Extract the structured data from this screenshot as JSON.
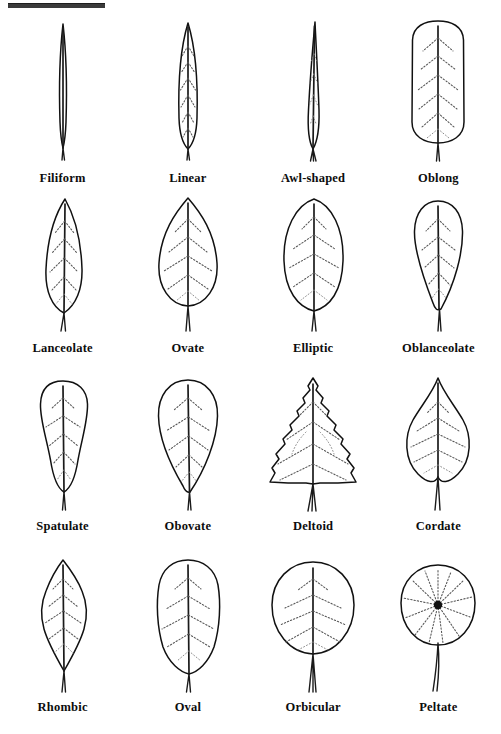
{
  "figure": {
    "top_rule": true,
    "background_color": "#ffffff",
    "ink_color": "#111111",
    "vein_color": "#555555",
    "columns": 4,
    "rows": 4
  },
  "leaves": [
    {
      "id": "filiform",
      "label": "Filiform",
      "row": 1,
      "col": 1,
      "shape": "thread-like, extremely narrow, parallel sides",
      "margin": "entire",
      "venation": "pinnate"
    },
    {
      "id": "linear",
      "label": "Linear",
      "row": 1,
      "col": 2,
      "shape": "long and narrow with parallel sides",
      "margin": "entire",
      "venation": "pinnate"
    },
    {
      "id": "awl-shaped",
      "label": "Awl-shaped",
      "row": 1,
      "col": 3,
      "shape": "tapering to a sharp point from a broad base",
      "margin": "entire",
      "venation": "pinnate"
    },
    {
      "id": "oblong",
      "label": "Oblong",
      "row": 1,
      "col": 4,
      "shape": "rectangular with rounded ends",
      "margin": "entire",
      "venation": "pinnate"
    },
    {
      "id": "lanceolate",
      "label": "Lanceolate",
      "row": 2,
      "col": 1,
      "shape": "lance-like, widest below middle",
      "margin": "entire",
      "venation": "pinnate"
    },
    {
      "id": "ovate",
      "label": "Ovate",
      "row": 2,
      "col": 2,
      "shape": "egg-shaped, widest near base",
      "margin": "entire",
      "venation": "pinnate"
    },
    {
      "id": "elliptic",
      "label": "Elliptic",
      "row": 2,
      "col": 3,
      "shape": "oval, widest at the middle",
      "margin": "entire",
      "venation": "pinnate"
    },
    {
      "id": "oblanceolate",
      "label": "Oblanceolate",
      "row": 2,
      "col": 4,
      "shape": "inverted lance, widest above middle",
      "margin": "entire",
      "venation": "pinnate"
    },
    {
      "id": "spatulate",
      "label": "Spatulate",
      "row": 3,
      "col": 1,
      "shape": "spoon-shaped, rounded tip, narrow base",
      "margin": "wavy",
      "venation": "pinnate"
    },
    {
      "id": "obovate",
      "label": "Obovate",
      "row": 3,
      "col": 2,
      "shape": "inverted egg, widest above middle",
      "margin": "entire",
      "venation": "pinnate"
    },
    {
      "id": "deltoid",
      "label": "Deltoid",
      "row": 3,
      "col": 3,
      "shape": "triangular",
      "margin": "serrate",
      "venation": "pinnate"
    },
    {
      "id": "cordate",
      "label": "Cordate",
      "row": 3,
      "col": 4,
      "shape": "heart-shaped with notched base",
      "margin": "entire",
      "venation": "pinnate"
    },
    {
      "id": "rhombic",
      "label": "Rhombic",
      "row": 4,
      "col": 1,
      "shape": "diamond-shaped",
      "margin": "crenate",
      "venation": "pinnate"
    },
    {
      "id": "oval",
      "label": "Oval",
      "row": 4,
      "col": 2,
      "shape": "broadly elliptic",
      "margin": "crenate",
      "venation": "pinnate"
    },
    {
      "id": "orbicular",
      "label": "Orbicular",
      "row": 4,
      "col": 3,
      "shape": "circular",
      "margin": "entire",
      "venation": "pinnate"
    },
    {
      "id": "peltate",
      "label": "Peltate",
      "row": 4,
      "col": 4,
      "shape": "shield-like, petiole attached at centre",
      "margin": "entire",
      "venation": "palmate-radiating"
    }
  ]
}
